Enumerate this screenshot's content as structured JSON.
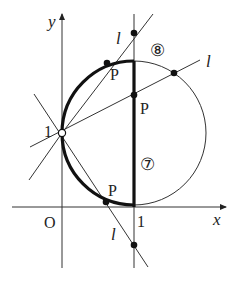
{
  "diagram": {
    "axes": {
      "x_label": "x",
      "y_label": "y",
      "origin_label": "O",
      "x_tick_label": "1",
      "y_tick_label": "1"
    },
    "line_labels": [
      "l",
      "l",
      "l"
    ],
    "point_labels": [
      "P",
      "P",
      "P"
    ],
    "region_labels": {
      "upper": "⑧",
      "lower": "⑦"
    },
    "colors": {
      "stroke": "#222222",
      "background": "#ffffff"
    }
  }
}
